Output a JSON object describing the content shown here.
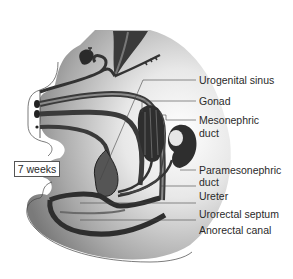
{
  "figure": {
    "stage_label": "7 weeks",
    "labels": [
      {
        "id": "urogenital-sinus",
        "text": "Urogenital sinus"
      },
      {
        "id": "gonad",
        "text": "Gonad"
      },
      {
        "id": "mesonephric-duct",
        "text": "Mesonephric",
        "text2": "duct"
      },
      {
        "id": "paramesonephric-duct",
        "text": "Paramesonephric",
        "text2": "duct"
      },
      {
        "id": "ureter",
        "text": "Ureter"
      },
      {
        "id": "urorectal-septum",
        "text": "Urorectal septum"
      },
      {
        "id": "anorectal-canal",
        "text": "Anorectal canal"
      }
    ]
  }
}
